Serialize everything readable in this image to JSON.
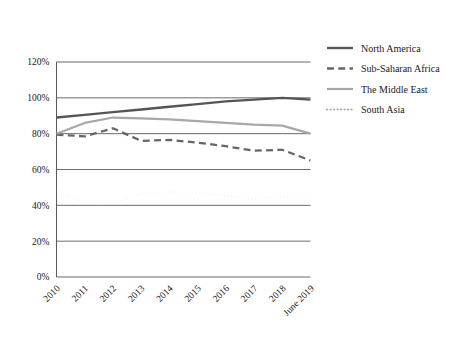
{
  "chart_data": {
    "type": "line",
    "title": "",
    "xlabel": "",
    "ylabel": "",
    "grid": true,
    "legend_position": "right",
    "ylim": [
      0,
      120
    ],
    "ytick_labels": [
      "0%",
      "20%",
      "40%",
      "60%",
      "80%",
      "100%",
      "120%"
    ],
    "ytick_values": [
      0,
      20,
      40,
      60,
      80,
      100,
      120
    ],
    "categories": [
      "2010",
      "2011",
      "2012",
      "2013",
      "2014",
      "2015",
      "2016",
      "2017",
      "2018",
      "June 2019"
    ],
    "series": [
      {
        "name": "North America",
        "style": "solid",
        "color": "#555555",
        "width": 2.4,
        "values": [
          89,
          90.5,
          92,
          93.5,
          95,
          96.5,
          98,
          99,
          100,
          99
        ]
      },
      {
        "name": "Sub-Saharan Africa",
        "style": "dashed",
        "color": "#666666",
        "width": 2.3,
        "values": [
          79.5,
          78.5,
          83,
          76,
          76.5,
          75,
          73,
          70.5,
          71,
          65
        ]
      },
      {
        "name": "The Middle East",
        "style": "solid",
        "color": "#a8a8a8",
        "width": 2.2,
        "values": [
          80,
          86,
          89,
          88.5,
          88,
          87,
          86,
          85,
          84.5,
          80
        ]
      },
      {
        "name": "South Asia",
        "style": "dotted",
        "color": "#aaaaaa",
        "width": 2.2,
        "values": [
          48,
          41.5,
          41,
          46.5,
          47.5,
          47,
          45.5,
          43.5,
          45,
          43.5
        ]
      }
    ]
  },
  "legend": {
    "items": [
      {
        "label": "North America"
      },
      {
        "label": "Sub-Saharan Africa"
      },
      {
        "label": "The Middle East"
      },
      {
        "label": "South Asia"
      }
    ]
  }
}
